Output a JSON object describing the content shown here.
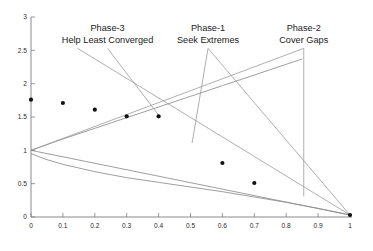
{
  "chart_data": {
    "type": "scatter",
    "title": "",
    "xlabel": "",
    "ylabel": "",
    "xlim": [
      0,
      1
    ],
    "ylim": [
      0,
      3
    ],
    "grid": false,
    "legend": "none",
    "x_ticks": [
      "0",
      "0.1",
      "0.2",
      "0.3",
      "0.4",
      "0.5",
      "0.6",
      "0.7",
      "0.8",
      "0.9",
      "1"
    ],
    "x_tick_values": [
      0,
      0.1,
      0.2,
      0.3,
      0.4,
      0.5,
      0.6,
      0.7,
      0.8,
      0.9,
      1
    ],
    "y_ticks": [
      "0",
      "0.5",
      "1",
      "1.5",
      "2",
      "2.5",
      "3"
    ],
    "y_tick_values": [
      0,
      0.5,
      1,
      1.5,
      2,
      2.5,
      3
    ],
    "series": [
      {
        "name": "samples",
        "marker": "filled-circle",
        "color": "#111111",
        "points": [
          {
            "x": 0.0,
            "y": 1.76
          },
          {
            "x": 0.1,
            "y": 1.71
          },
          {
            "x": 0.2,
            "y": 1.61
          },
          {
            "x": 0.3,
            "y": 1.51
          },
          {
            "x": 0.4,
            "y": 1.51
          },
          {
            "x": 0.6,
            "y": 0.81
          },
          {
            "x": 0.7,
            "y": 0.51
          },
          {
            "x": 1.0,
            "y": 0.03
          }
        ]
      }
    ],
    "curves": [
      {
        "name": "upper-envelope",
        "color": "#8d8d8d",
        "points": [
          {
            "x": 0.0,
            "y": 1.0
          },
          {
            "x": 0.1,
            "y": 1.17
          },
          {
            "x": 0.2,
            "y": 1.33
          },
          {
            "x": 0.3,
            "y": 1.49
          },
          {
            "x": 0.4,
            "y": 1.65
          },
          {
            "x": 0.5,
            "y": 1.81
          },
          {
            "x": 0.6,
            "y": 1.97
          },
          {
            "x": 0.7,
            "y": 2.13
          },
          {
            "x": 0.8,
            "y": 2.29
          },
          {
            "x": 0.85,
            "y": 2.37
          }
        ]
      },
      {
        "name": "lower-decay-curve",
        "color": "#8d8d8d",
        "points": [
          {
            "x": 0.0,
            "y": 0.95
          },
          {
            "x": 0.05,
            "y": 0.86
          },
          {
            "x": 0.1,
            "y": 0.79
          },
          {
            "x": 0.2,
            "y": 0.68
          },
          {
            "x": 0.3,
            "y": 0.59
          },
          {
            "x": 0.4,
            "y": 0.52
          },
          {
            "x": 0.5,
            "y": 0.45
          },
          {
            "x": 0.6,
            "y": 0.38
          },
          {
            "x": 0.7,
            "y": 0.3
          },
          {
            "x": 0.8,
            "y": 0.22
          },
          {
            "x": 0.9,
            "y": 0.13
          },
          {
            "x": 1.0,
            "y": 0.03
          }
        ]
      },
      {
        "name": "descending-straight-line",
        "color": "#9a9a9a",
        "points": [
          {
            "x": 0.0,
            "y": 1.0
          },
          {
            "x": 1.0,
            "y": 0.03
          }
        ]
      }
    ],
    "annotations": [
      {
        "id": "phase-3",
        "line1": "Phase-3",
        "line2": "Help Least Converged",
        "label_x": 0.24,
        "label_y": 2.83,
        "target_x": 0.4,
        "target_y": 1.53
      },
      {
        "id": "phase-1",
        "line1": "Phase-1",
        "line2": "Seek Extremes",
        "label_x": 0.555,
        "label_y": 2.83,
        "target_x": 0.505,
        "target_y": 1.11
      },
      {
        "id": "phase-2",
        "line1": "Phase-2",
        "line2": "Cover Gaps",
        "label_x": 0.855,
        "label_y": 2.83,
        "target_x": 0.855,
        "target_y": 0.31
      }
    ]
  }
}
